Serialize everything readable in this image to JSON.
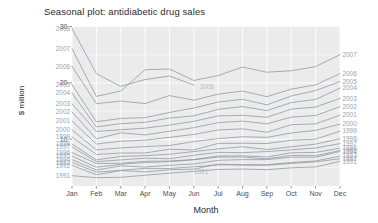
{
  "chart_data": {
    "type": "line",
    "title": "Seasonal plot: antidiabetic drug sales",
    "xlabel": "Month",
    "ylabel": "$ million",
    "categories": [
      "Jan",
      "Feb",
      "Mar",
      "Apr",
      "May",
      "Jun",
      "Jul",
      "Aug",
      "Sep",
      "Oct",
      "Nov",
      "Dec"
    ],
    "x_tick_labels": [
      "Jan",
      "Feb",
      "Mar",
      "Apr",
      "May",
      "Jun",
      "Jul",
      "Aug",
      "Sep",
      "Oct",
      "Nov",
      "Dec"
    ],
    "y_tick_labels": [
      "10",
      "20",
      "30"
    ],
    "y_tick_values": [
      10,
      20,
      30
    ],
    "ylim": [
      1.7,
      30.1
    ],
    "xlim": [
      1,
      12
    ],
    "grid": true,
    "legend_position": "inline-series-labels",
    "panel_background": "#ebebeb",
    "gridline_color": "#ffffff",
    "line_color": "#8c95a0",
    "label_color": "#9aa3ad",
    "series": [
      {
        "name": "1991",
        "label_left": "1991",
        "label_right": "1991",
        "label_inner": "1991",
        "values": [
          3.53,
          3.18,
          3.25,
          3.61,
          3.97,
          4.31,
          4.64,
          4.71,
          4.6,
          4.93,
          5.08,
          6.07
        ]
      },
      {
        "name": "1992",
        "label_left": "1992",
        "label_right": "1992",
        "label_inner": null,
        "values": [
          5.35,
          3.71,
          4.44,
          4.2,
          4.59,
          4.69,
          5.59,
          5.41,
          5.39,
          5.72,
          5.98,
          6.54
        ]
      },
      {
        "name": "1993",
        "label_left": "1993",
        "label_right": "1993",
        "label_inner": null,
        "values": [
          5.88,
          4.16,
          4.48,
          4.83,
          4.81,
          5.1,
          5.44,
          5.49,
          5.48,
          5.86,
          6.14,
          6.99
        ]
      },
      {
        "name": "1994",
        "label_left": "1994",
        "label_right": "1994",
        "label_inner": null,
        "values": [
          6.37,
          4.55,
          5.26,
          5.06,
          5.38,
          5.61,
          6.26,
          6.38,
          6.38,
          6.82,
          6.81,
          7.82
        ]
      },
      {
        "name": "1995",
        "label_left": "1995",
        "label_right": "1995",
        "label_inner": null,
        "values": [
          7.0,
          5.02,
          5.56,
          5.87,
          6.03,
          6.35,
          6.83,
          6.85,
          6.51,
          7.13,
          7.08,
          8.0
        ]
      },
      {
        "name": "1996",
        "label_left": "1996",
        "label_right": "1996",
        "label_inner": null,
        "values": [
          7.63,
          5.7,
          5.74,
          6.09,
          6.13,
          6.4,
          7.03,
          7.05,
          6.85,
          7.59,
          7.66,
          8.41
        ]
      },
      {
        "name": "1997",
        "label_left": "1997",
        "label_right": "1997",
        "label_inner": null,
        "values": [
          8.64,
          6.03,
          6.33,
          6.64,
          6.54,
          7.16,
          7.67,
          7.62,
          7.82,
          8.11,
          8.45,
          9.22
        ]
      },
      {
        "name": "1998",
        "label_left": "1998",
        "label_right": "1998",
        "label_inner": null,
        "values": [
          9.14,
          6.34,
          6.94,
          7.08,
          7.34,
          7.81,
          8.28,
          8.66,
          8.19,
          8.66,
          9.13,
          10.1
        ]
      },
      {
        "name": "1999",
        "label_left": "1999",
        "label_right": "1999",
        "label_inner": null,
        "values": [
          10.39,
          7.3,
          7.55,
          7.56,
          8.23,
          8.09,
          9.26,
          9.29,
          9.24,
          9.82,
          10.02,
          11.43
        ]
      },
      {
        "name": "2000",
        "label_left": "2000",
        "label_right": "2000",
        "label_inner": null,
        "values": [
          11.64,
          8.11,
          8.46,
          8.69,
          8.89,
          9.59,
          10.11,
          10.44,
          10.33,
          11.11,
          11.57,
          12.68
        ]
      },
      {
        "name": "2001",
        "label_left": "2001",
        "label_right": "2001",
        "label_inner": null,
        "values": [
          13.23,
          9.15,
          9.64,
          9.84,
          10.34,
          10.85,
          11.65,
          11.85,
          11.24,
          12.58,
          12.73,
          14.27
        ]
      },
      {
        "name": "2002",
        "label_left": "2002",
        "label_right": "2002",
        "label_inner": null,
        "values": [
          14.85,
          10.06,
          11.15,
          10.77,
          11.42,
          12.06,
          12.95,
          13.22,
          12.74,
          13.93,
          14.21,
          15.76
        ]
      },
      {
        "name": "2003",
        "label_left": "2003",
        "label_right": "2003",
        "label_inner": null,
        "values": [
          16.3,
          11.39,
          11.68,
          11.97,
          12.51,
          13.18,
          14.14,
          14.24,
          13.91,
          15.34,
          15.72,
          17.24
        ]
      },
      {
        "name": "2004",
        "label_left": "2004",
        "label_right": "2004",
        "label_inner": null,
        "values": [
          18.18,
          12.19,
          12.76,
          13.01,
          13.76,
          14.15,
          15.3,
          15.8,
          15.07,
          16.51,
          17.07,
          19.07
        ]
      },
      {
        "name": "2005",
        "label_left": "2005",
        "label_right": "2005",
        "label_inner": null,
        "values": [
          19.69,
          13.11,
          13.69,
          13.83,
          14.75,
          15.55,
          16.6,
          17.09,
          16.1,
          17.68,
          18.64,
          20.23
        ]
      },
      {
        "name": "2006",
        "label_left": "2006",
        "label_right": "2006",
        "label_inner": null,
        "values": [
          22.93,
          16.31,
          16.78,
          16.33,
          17.75,
          16.94,
          18.0,
          18.55,
          17.56,
          18.89,
          19.65,
          21.65
        ]
      },
      {
        "name": "2007",
        "label_left": "2007",
        "label_right": "2007",
        "label_inner": null,
        "values": [
          26.08,
          17.61,
          18.56,
          22.33,
          22.47,
          20.43,
          21.31,
          22.81,
          21.9,
          22.15,
          22.89,
          25.0
        ]
      },
      {
        "name": "2008",
        "label_left": "2008",
        "label_right": null,
        "label_inner": "2008",
        "values": [
          29.66,
          21.65,
          19.39,
          20.6,
          21.23,
          19.62,
          null,
          null,
          null,
          null,
          null,
          null
        ]
      }
    ]
  }
}
